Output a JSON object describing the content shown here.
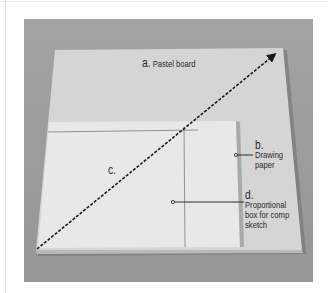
{
  "figure": {
    "type": "illustration",
    "labels": {
      "a": {
        "letter": "a.",
        "text": "Pastel board"
      },
      "b": {
        "letter": "b.",
        "lines": [
          "Drawing",
          "paper"
        ]
      },
      "c": {
        "letter": "c."
      },
      "d": {
        "letter": "d.",
        "lines": [
          "Proportional",
          "box for comp",
          "sketch"
        ]
      }
    },
    "colors": {
      "background": "#ffffff",
      "backdrop": "#9a9a9a",
      "board": "#d4d4d4",
      "paper": "#e9e9e9",
      "line": "#1a1a1a",
      "text": "#2a2a2a"
    }
  }
}
